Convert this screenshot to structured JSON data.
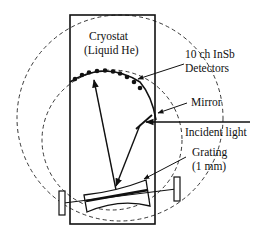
{
  "diagram": {
    "type": "spectrometer-schematic",
    "labels": {
      "cryostat_line1": "Cryostat",
      "cryostat_line2": "(Liquid He)",
      "detectors_line1": "10 ch InSb",
      "detectors_line2": "Detectors",
      "mirror": "Mirror",
      "incident_light": "Incident light",
      "grating_line1": "Grating",
      "grating_line2": "(1 mm)"
    },
    "detector_count": 10,
    "colors": {
      "line": "#111111",
      "background": "#ffffff"
    }
  }
}
